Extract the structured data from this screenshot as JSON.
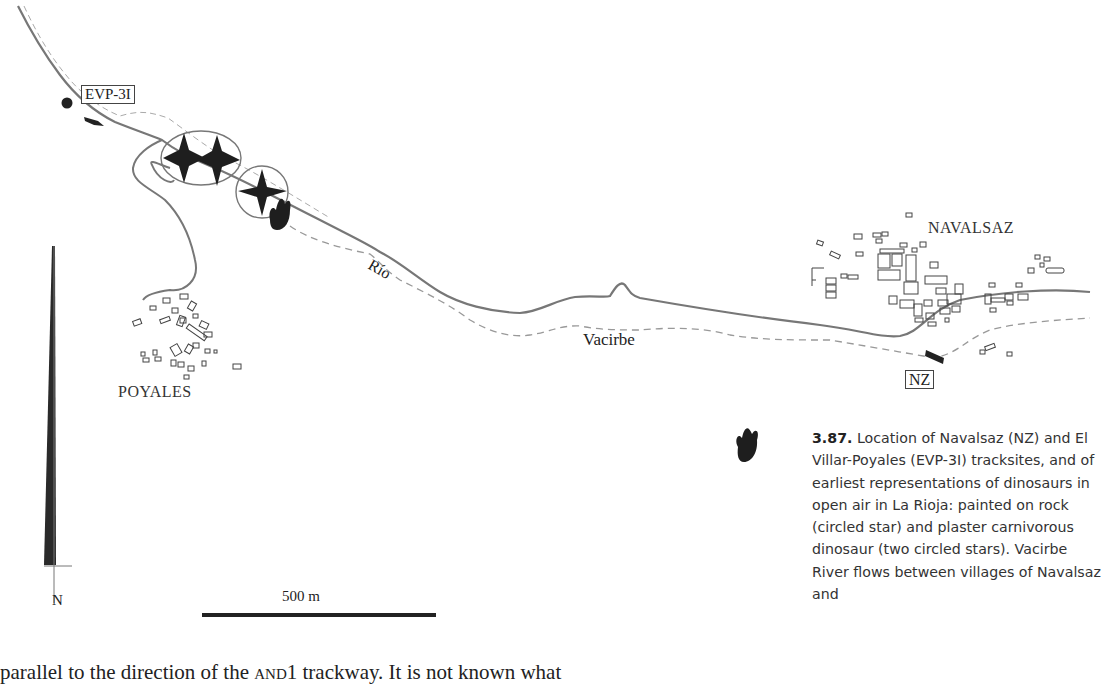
{
  "figure": {
    "type": "location map",
    "sites": [
      {
        "code": "EVP-3I",
        "name": "El Villar-Poyales"
      },
      {
        "code": "NZ",
        "name": "Navalsaz"
      }
    ],
    "villages": [
      "NAVALSAZ",
      "POYALES"
    ],
    "river": {
      "label_part1": "Río",
      "label_part2": "Vacirbe"
    },
    "north_arrow": {
      "label": "N"
    },
    "scale_bar": {
      "label": "500 m"
    },
    "symbols": [
      {
        "name": "circled-star",
        "meaning": "painted on rock"
      },
      {
        "name": "two-circled-stars",
        "meaning": "plaster carnivorous dinosaur"
      },
      {
        "name": "footprint",
        "meaning": "dinosaur track"
      }
    ]
  },
  "caption": {
    "number": "3.87.",
    "text": "Location of Navalsaz (NZ) and El Villar-Poyales (EVP-3I) tracksites, and of earliest representations of dinosaurs in open air in La Rioja: painted on rock (circled star) and plaster carnivorous dinosaur (two circled stars). Vacirbe River flows between villages of Navalsaz and"
  },
  "body_text": {
    "before": "parallel to the direction of the ",
    "smallcaps": "and1",
    "after": " trackway. It is not known what"
  }
}
